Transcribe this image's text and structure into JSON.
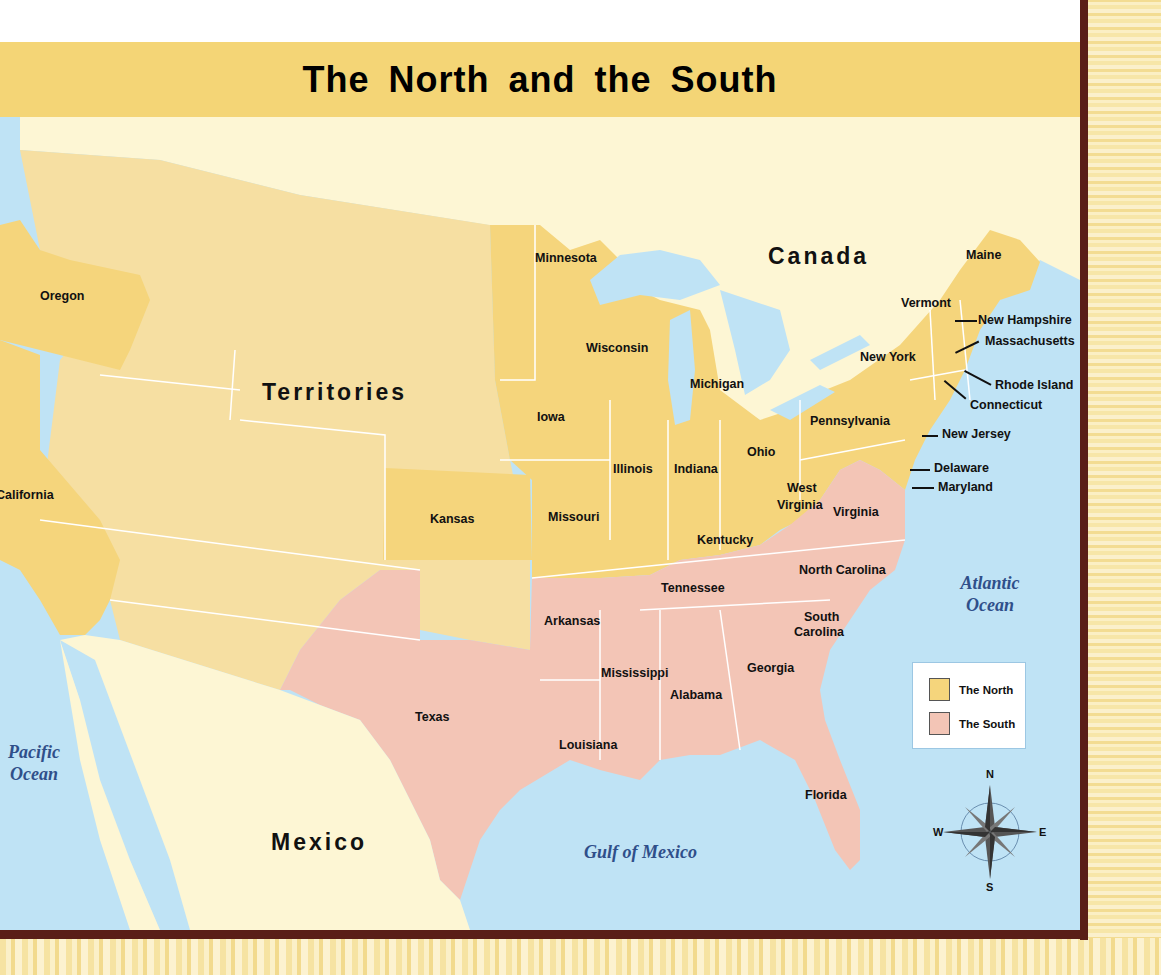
{
  "title": "The North and the South",
  "colors": {
    "north": "#f5d57c",
    "territories": "#f6dfa2",
    "south": "#f3c5b6",
    "foreign_land": "#fdf6d4",
    "water": "#bfe3f5",
    "frame": "#5a1e17",
    "title_band": "#f4d576",
    "ocean_text": "#2f4f8a"
  },
  "regions": {
    "territories": "Territories",
    "canada": "Canada",
    "mexico": "Mexico"
  },
  "water_bodies": {
    "pacific": "Pacific Ocean",
    "atlantic": "Atlantic Ocean",
    "gulf": "Gulf of Mexico"
  },
  "north_states": [
    "Oregon",
    "California",
    "Kansas",
    "Minnesota",
    "Iowa",
    "Wisconsin",
    "Michigan",
    "Illinois",
    "Indiana",
    "Ohio",
    "Missouri",
    "Kentucky",
    "West Virginia",
    "Pennsylvania",
    "New York",
    "Vermont",
    "Maine",
    "New Hampshire",
    "Massachusetts",
    "Rhode Island",
    "Connecticut",
    "New Jersey",
    "Delaware",
    "Maryland"
  ],
  "south_states": [
    "Virginia",
    "North Carolina",
    "South Carolina",
    "Georgia",
    "Florida",
    "Alabama",
    "Mississippi",
    "Louisiana",
    "Texas",
    "Arkansas",
    "Tennessee"
  ],
  "labels": {
    "oregon": "Oregon",
    "california": "California",
    "kansas": "Kansas",
    "minnesota": "Minnesota",
    "iowa": "Iowa",
    "wisconsin": "Wisconsin",
    "michigan": "Michigan",
    "illinois": "Illinois",
    "indiana": "Indiana",
    "ohio": "Ohio",
    "missouri": "Missouri",
    "kentucky": "Kentucky",
    "west_virginia_1": "West",
    "west_virginia_2": "Virginia",
    "pennsylvania": "Pennsylvania",
    "new_york": "New York",
    "vermont": "Vermont",
    "maine": "Maine",
    "new_hampshire": "New Hampshire",
    "massachusetts": "Massachusetts",
    "rhode_island": "Rhode Island",
    "connecticut": "Connecticut",
    "new_jersey": "New Jersey",
    "delaware": "Delaware",
    "maryland": "Maryland",
    "virginia": "Virginia",
    "north_carolina": "North Carolina",
    "south_carolina_1": "South",
    "south_carolina_2": "Carolina",
    "georgia": "Georgia",
    "florida": "Florida",
    "alabama": "Alabama",
    "mississippi": "Mississippi",
    "louisiana": "Louisiana",
    "texas": "Texas",
    "arkansas": "Arkansas",
    "tennessee": "Tennessee"
  },
  "ocean_lines": {
    "pacific_1": "Pacific",
    "pacific_2": "Ocean",
    "atlantic_1": "Atlantic",
    "atlantic_2": "Ocean",
    "gulf": "Gulf  of  Mexico"
  },
  "legend": {
    "items": [
      {
        "label": "The North",
        "color": "#f5d57c"
      },
      {
        "label": "The South",
        "color": "#f3c5b6"
      }
    ]
  },
  "compass": {
    "n": "N",
    "s": "S",
    "e": "E",
    "w": "W"
  }
}
